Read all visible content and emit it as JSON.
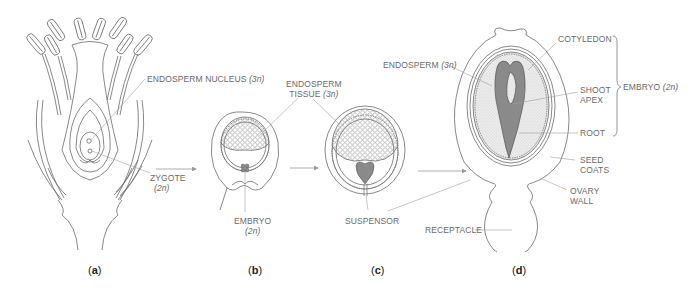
{
  "figure": {
    "type": "botanical development diagram"
  },
  "panels": [
    {
      "id": "a",
      "label": "(a)",
      "letter": "a"
    },
    {
      "id": "b",
      "label": "(b)",
      "letter": "b"
    },
    {
      "id": "c",
      "label": "(c)",
      "letter": "c"
    },
    {
      "id": "d",
      "label": "(d)",
      "letter": "d"
    }
  ],
  "labels": {
    "endosperm_nucleus": {
      "text": "ENDOSPERM NUCLEUS",
      "ploidy": "(3n)"
    },
    "zygote": {
      "text": "ZYGOTE",
      "ploidy": "(2n)"
    },
    "endosperm_tissue_line1": "ENDOSPERM",
    "endosperm_tissue_line2": "TISSUE",
    "endosperm_tissue_ploidy": "(3n)",
    "embryo_b": {
      "text": "EMBRYO",
      "ploidy": "(2n)"
    },
    "suspensor": "SUSPENSOR",
    "endosperm_d": {
      "text": "ENDOSPERM",
      "ploidy": "(3n)"
    },
    "cotyledon": "COTYLEDON",
    "shoot_apex_line1": "SHOOT",
    "shoot_apex_line2": "APEX",
    "root": "ROOT",
    "embryo_d": {
      "text": "EMBRYO",
      "ploidy": "(2n)"
    },
    "seed_coats_line1": "SEED",
    "seed_coats_line2": "COATS",
    "ovary_wall_line1": "OVARY",
    "ovary_wall_line2": "WALL",
    "receptacle": "RECEPTACLE"
  },
  "colors": {
    "line": "#6b6b6b",
    "leader": "#9a9a9a",
    "arrow": "#9a9a9a",
    "embryo_fill": "#8c8c8c",
    "endosperm_fill": "#e4e4e4",
    "text": "#6a6a6a"
  }
}
